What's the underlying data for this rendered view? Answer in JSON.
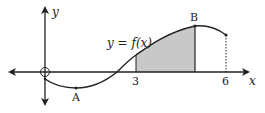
{
  "diagram": {
    "curve_label": "y = f(x)",
    "y_axis_label": "y",
    "x_axis_label": "x",
    "origin_label": "O",
    "points": [
      {
        "name": "A",
        "label": "A"
      },
      {
        "name": "B",
        "label": "B"
      }
    ],
    "tick_labels": [
      "3",
      "6"
    ],
    "colors": {
      "curve": "#222222",
      "shade": "#c8c8c8",
      "axis": "#222222"
    }
  }
}
